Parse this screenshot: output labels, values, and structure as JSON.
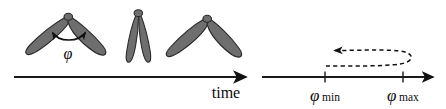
{
  "figure": {
    "background_color": "#ffffff",
    "ink_color": "#111111",
    "wing_fill_color": "#6e6e6e",
    "wing_outline_color": "#2b2b2b",
    "width": 446,
    "height": 109
  },
  "left_panel": {
    "name": "wing-stroke-sequence",
    "axis_label": "time",
    "angle_label": "φ",
    "wing_count": 3,
    "wing_states": [
      {
        "id": "wing-pose-1",
        "description": "wings spread wide downward-outward",
        "pivot_x": 68,
        "pivot_y": 17
      },
      {
        "id": "wing-pose-2",
        "description": "wings nearly closed pointing downward",
        "pivot_x": 138,
        "pivot_y": 13
      },
      {
        "id": "wing-pose-3",
        "description": "wings spread wide downward-outward",
        "pivot_x": 207,
        "pivot_y": 19
      }
    ],
    "angle_arc": {
      "description": "double-headed arc spanning the stroke angle between the two wings",
      "label": "φ"
    }
  },
  "right_panel": {
    "name": "stroke-angle-axis",
    "ticks": [
      {
        "id": "tick-phi-min",
        "symbol": "φ",
        "subscript": "min",
        "x": 325
      },
      {
        "id": "tick-phi-max",
        "symbol": "φ",
        "subscript": "max",
        "x": 403
      }
    ],
    "loop": {
      "description": "dashed hairpin trajectory looping from phi-max back toward phi-min with leftward arrowhead",
      "arrow_direction": "left",
      "style": "dashed"
    }
  }
}
